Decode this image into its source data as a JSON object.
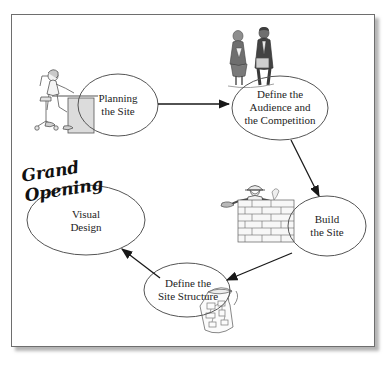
{
  "page": {
    "background_color": "#ffffff",
    "sheet_border_color": "#6e6e6e",
    "ink_color": "#1d1d1d"
  },
  "diagram": {
    "type": "cycle-flowchart",
    "orientation": "clockwise",
    "nodes": [
      {
        "id": "planning",
        "label": "Planning\nthe Site",
        "shape": "ellipse",
        "cx": 118,
        "cy": 105,
        "rx": 40,
        "ry": 31,
        "illustration": "person-at-desk-icon"
      },
      {
        "id": "audience",
        "label": "Define the\nAudience and\nthe Competition",
        "shape": "ellipse",
        "cx": 280,
        "cy": 108,
        "rx": 48,
        "ry": 32,
        "illustration": "two-business-people-icon"
      },
      {
        "id": "build",
        "label": "Build\nthe Site",
        "shape": "ellipse",
        "cx": 327,
        "cy": 226,
        "rx": 39,
        "ry": 30,
        "illustration": "bricklayer-icon"
      },
      {
        "id": "structure",
        "label": "Define the\nSite Structure",
        "shape": "ellipse",
        "cx": 187,
        "cy": 290,
        "rx": 43,
        "ry": 27,
        "illustration": "blueprint-scroll-icon"
      },
      {
        "id": "visual",
        "label": "Visual\nDesign",
        "shape": "ellipse",
        "cx": 86,
        "cy": 220,
        "rx": 59,
        "ry": 35,
        "illustration": "grand-opening-banner-text"
      }
    ],
    "edges": [
      {
        "from": "planning",
        "to": "audience",
        "style": "solid-arrow",
        "direction": "right"
      },
      {
        "from": "audience",
        "to": "build",
        "style": "solid-arrow",
        "direction": "down-right"
      },
      {
        "from": "build",
        "to": "structure",
        "style": "solid-arrow",
        "direction": "down-left"
      },
      {
        "from": "structure",
        "to": "visual",
        "style": "solid-arrow",
        "direction": "up-left"
      }
    ],
    "annotations": [
      {
        "id": "grand-opening",
        "text": "Grand\nOpening",
        "style": "script-italic-bold",
        "rotation_deg": -9
      }
    ]
  }
}
